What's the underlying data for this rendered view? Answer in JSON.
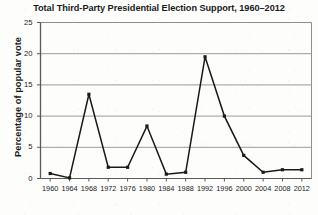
{
  "chart_data": {
    "type": "line",
    "title": "Total Third-Party Presidential Election Support, 1960–2012",
    "xlabel": "",
    "ylabel": "Percentage of popular vote",
    "categories": [
      "1960",
      "1964",
      "1968",
      "1972",
      "1976",
      "1980",
      "1984",
      "1988",
      "1992",
      "1996",
      "2000",
      "2004",
      "2008",
      "2012"
    ],
    "values": [
      0.8,
      0.1,
      13.5,
      1.8,
      1.8,
      8.4,
      0.7,
      1.0,
      19.5,
      10.0,
      3.7,
      1.0,
      1.4,
      1.4
    ],
    "series": [
      {
        "name": "Total third-party support",
        "values": [
          0.8,
          0.1,
          13.5,
          1.8,
          1.8,
          8.4,
          0.7,
          1.0,
          19.5,
          10.0,
          3.7,
          1.0,
          1.4,
          1.4
        ]
      }
    ],
    "ylim": [
      0,
      25
    ],
    "yticks": [
      "0",
      "5",
      "10",
      "15",
      "20",
      "25"
    ],
    "ytick_values": [
      0,
      5,
      10,
      15,
      20,
      25
    ],
    "grid": "horizontal",
    "legend": "none",
    "marker": "square",
    "line_color": "#1a1a1a",
    "marker_color": "#1a1a1a",
    "grid_color": "#8f8f8f",
    "axis_color": "#5a5a5a",
    "background_color": "#fdfdfc"
  }
}
